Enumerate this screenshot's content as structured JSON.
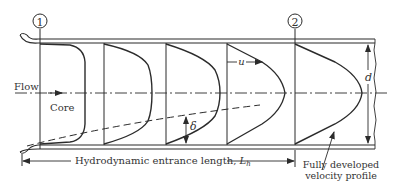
{
  "diagram": {
    "stations": [
      {
        "label": "1",
        "x": 40
      },
      {
        "label": "2",
        "x": 295
      }
    ],
    "labels": {
      "flow": "Flow",
      "core": "Core",
      "velocity": "u",
      "boundary_layer": "δ",
      "diameter": "d",
      "entrance_length": "Hydrodynamic entrance length, ",
      "entrance_symbol": "L",
      "entrance_subscript": "h",
      "fully_developed_line1": "Fully developed",
      "fully_developed_line2": "velocity profile"
    },
    "profiles": [
      {
        "name": "profile-1-uniform",
        "base_x": 40,
        "max_x": 85
      },
      {
        "name": "profile-2",
        "base_x": 104,
        "max_x": 152
      },
      {
        "name": "profile-3",
        "base_x": 166,
        "max_x": 220
      },
      {
        "name": "profile-4",
        "base_x": 227,
        "max_x": 285
      },
      {
        "name": "profile-5-fully-developed",
        "base_x": 295,
        "max_x": 362
      }
    ],
    "colors": {
      "line": "#2b2b2b",
      "text": "#333333",
      "background": "#ffffff"
    }
  }
}
